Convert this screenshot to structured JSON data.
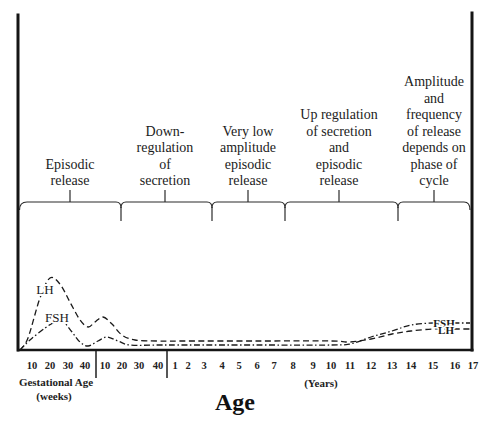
{
  "chart_data": {
    "type": "line",
    "title": "",
    "xlabel": "Age",
    "ylabel": "",
    "y_units": "relative secretion level (no y-axis scale shown)",
    "grid": false,
    "legend": "inline curve labels",
    "phases": [
      {
        "lines": [
          "Episodic",
          "release"
        ]
      },
      {
        "lines": [
          "Down-",
          "regulation",
          "of",
          "secretion"
        ]
      },
      {
        "lines": [
          "Very low",
          "amplitude",
          "episodic",
          "release"
        ]
      },
      {
        "lines": [
          "Up regulation",
          "of secretion",
          "and",
          "episodic",
          "release"
        ]
      },
      {
        "lines": [
          "Amplitude",
          "and",
          "frequency",
          "of release",
          "depends on",
          "phase of",
          "cycle"
        ]
      }
    ],
    "x_tick_groups": [
      {
        "label": "Gestational Age",
        "unit": "(weeks)",
        "ticks": [
          "10",
          "20",
          "30",
          "40"
        ]
      },
      {
        "ticks": [
          "10",
          "20",
          "30",
          "40"
        ]
      },
      {
        "unit": "(Years)",
        "ticks": [
          "1",
          "2",
          "3",
          "4",
          "5",
          "6",
          "7",
          "8",
          "9",
          "10",
          "11",
          "12",
          "13",
          "14",
          "15",
          "16",
          "17"
        ]
      }
    ],
    "curve_labels": {
      "lh_left": "LH",
      "fsh_left": "FSH",
      "fsh_right": "FSH",
      "lh_right": "LH"
    },
    "series": [
      {
        "name": "LH",
        "style": "dashed",
        "points": [
          [
            -0.769,
            0
          ],
          [
            -0.641,
            12
          ],
          [
            -0.487,
            52
          ],
          [
            -0.375,
            72
          ],
          [
            -0.274,
            66
          ],
          [
            -0.175,
            48
          ],
          [
            -0.087,
            30
          ],
          [
            -0.017,
            23
          ],
          [
            0.06,
            28
          ],
          [
            0.156,
            33
          ],
          [
            0.256,
            26
          ],
          [
            0.363,
            15
          ],
          [
            0.517,
            10
          ],
          [
            0.769,
            9
          ],
          [
            2,
            9
          ],
          [
            6,
            9
          ],
          [
            10,
            9
          ],
          [
            11,
            8
          ],
          [
            12,
            11
          ],
          [
            13,
            16
          ],
          [
            14,
            19
          ],
          [
            15,
            21
          ],
          [
            16,
            21
          ],
          [
            17,
            21
          ]
        ]
      },
      {
        "name": "FSH",
        "style": "dash-dot",
        "points": [
          [
            -0.769,
            0
          ],
          [
            -0.609,
            10
          ],
          [
            -0.43,
            22
          ],
          [
            -0.324,
            28
          ],
          [
            -0.254,
            30
          ],
          [
            -0.157,
            18
          ],
          [
            -0.087,
            8
          ],
          [
            -0.017,
            4
          ],
          [
            0.096,
            9
          ],
          [
            0.203,
            13
          ],
          [
            0.32,
            9
          ],
          [
            0.457,
            5
          ],
          [
            0.769,
            5
          ],
          [
            2,
            5
          ],
          [
            6,
            5
          ],
          [
            10,
            5
          ],
          [
            11,
            6
          ],
          [
            12,
            13
          ],
          [
            13,
            19
          ],
          [
            14,
            25
          ],
          [
            15,
            27
          ],
          [
            16,
            27
          ],
          [
            17,
            27
          ]
        ]
      }
    ],
    "x_note": "x = age in years (negative = gestational period; 0 = birth)"
  }
}
